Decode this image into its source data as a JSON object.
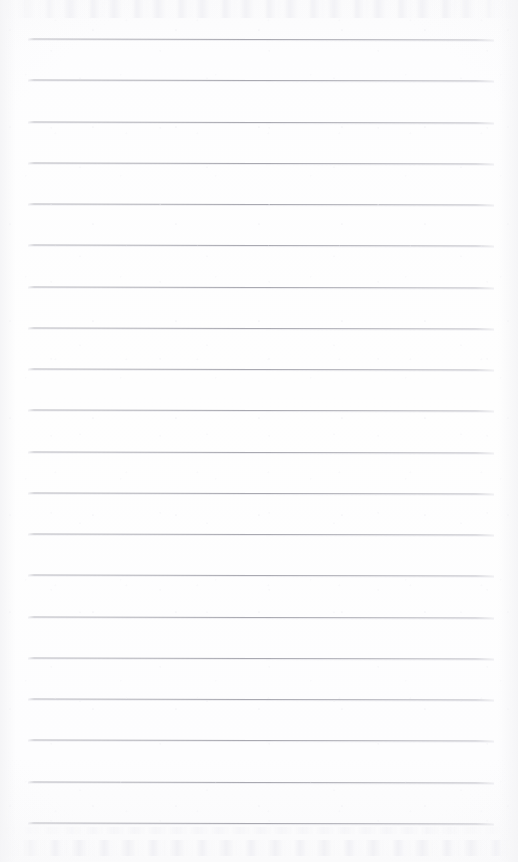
{
  "document": {
    "kind": "scanned-ruled-notebook-page",
    "title": "Blank Ruled Page",
    "written_text": "",
    "page_width": 518,
    "page_height": 862,
    "background_color": "#fdfdfe",
    "paper_edge_tint": "#fafafb"
  },
  "ruling": {
    "line_count": 20,
    "line_color": "#abaeb4",
    "line_highlight_color": "#dbdbe2",
    "line_thickness": 1,
    "first_line_y": 39,
    "line_spacing": 41.2,
    "left_x": 28,
    "right_x": 494,
    "positions_y": [
      39,
      80,
      122,
      163,
      204,
      245,
      287,
      328,
      369,
      410,
      452,
      493,
      534,
      575,
      617,
      658,
      699,
      740,
      782,
      823
    ]
  },
  "artifacts": {
    "top_bleed_through": {
      "label": "faint-ghost-text-top",
      "y": 0,
      "height": 18,
      "color": "#f0f0f4",
      "legible": "no"
    },
    "bottom_bleed_through": {
      "label": "faint-ghost-text-bottom",
      "y": 840,
      "height": 16,
      "color": "#eff0f4",
      "legible": "no"
    },
    "bottom_bleed_through_secondary": {
      "label": "faint-ghost-text-bottom-upper",
      "y": 827,
      "height": 7,
      "color": "#f2f2f6",
      "legible": "no"
    }
  }
}
